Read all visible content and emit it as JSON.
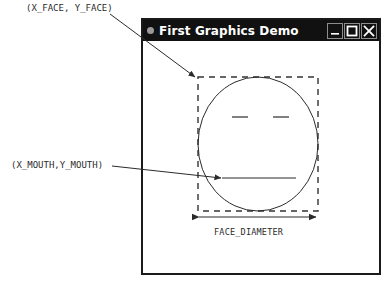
{
  "window": {
    "title": "First Graphics Demo",
    "app_icon": "circle-dot-icon",
    "controls": [
      {
        "name": "minimize",
        "glyph": "minimize-icon",
        "label": "Minimize"
      },
      {
        "name": "maximize",
        "glyph": "maximize-icon",
        "label": "Maximize"
      },
      {
        "name": "close",
        "glyph": "close-icon",
        "label": "Close"
      }
    ]
  },
  "annotations": {
    "face_point": "(X_FACE, Y_FACE)",
    "mouth_point": "(X_MOUTH,Y_MOUTH)",
    "diameter": "FACE_DIAMETER"
  },
  "colors": {
    "titlebar_bg": "#111111",
    "titlebar_text": "#ffffff",
    "window_border": "#1a1a1a",
    "canvas_bg": "#ffffff",
    "ink": "#2b2b2b",
    "dashed_box": "#333333",
    "button_border": "#8d8d8d",
    "app_dot": "#9a9a9a"
  },
  "drawing": {
    "bounding_box": {
      "x": 198,
      "y": 77,
      "width": 120,
      "height": 134,
      "style": "dashed"
    },
    "face_circle": {
      "cx": 258,
      "cy": 144,
      "rx": 60,
      "ry": 67
    },
    "eyes": [
      {
        "x1": 232,
        "y1": 117,
        "x2": 248,
        "y2": 117
      },
      {
        "x1": 273,
        "y1": 117,
        "x2": 289,
        "y2": 117
      }
    ],
    "mouth": {
      "x1": 222,
      "y1": 178,
      "x2": 296,
      "y2": 178
    },
    "dimension_line": {
      "x1": 197,
      "y1": 217,
      "x2": 318,
      "y2": 217,
      "arrows": "both"
    },
    "leaders": [
      {
        "name": "face-leader",
        "x1": 110,
        "y1": 14,
        "x2": 196,
        "y2": 78,
        "arrow": "end"
      },
      {
        "name": "mouth-leader",
        "x1": 112,
        "y1": 166,
        "x2": 222,
        "y2": 178,
        "arrow": "end"
      }
    ]
  }
}
